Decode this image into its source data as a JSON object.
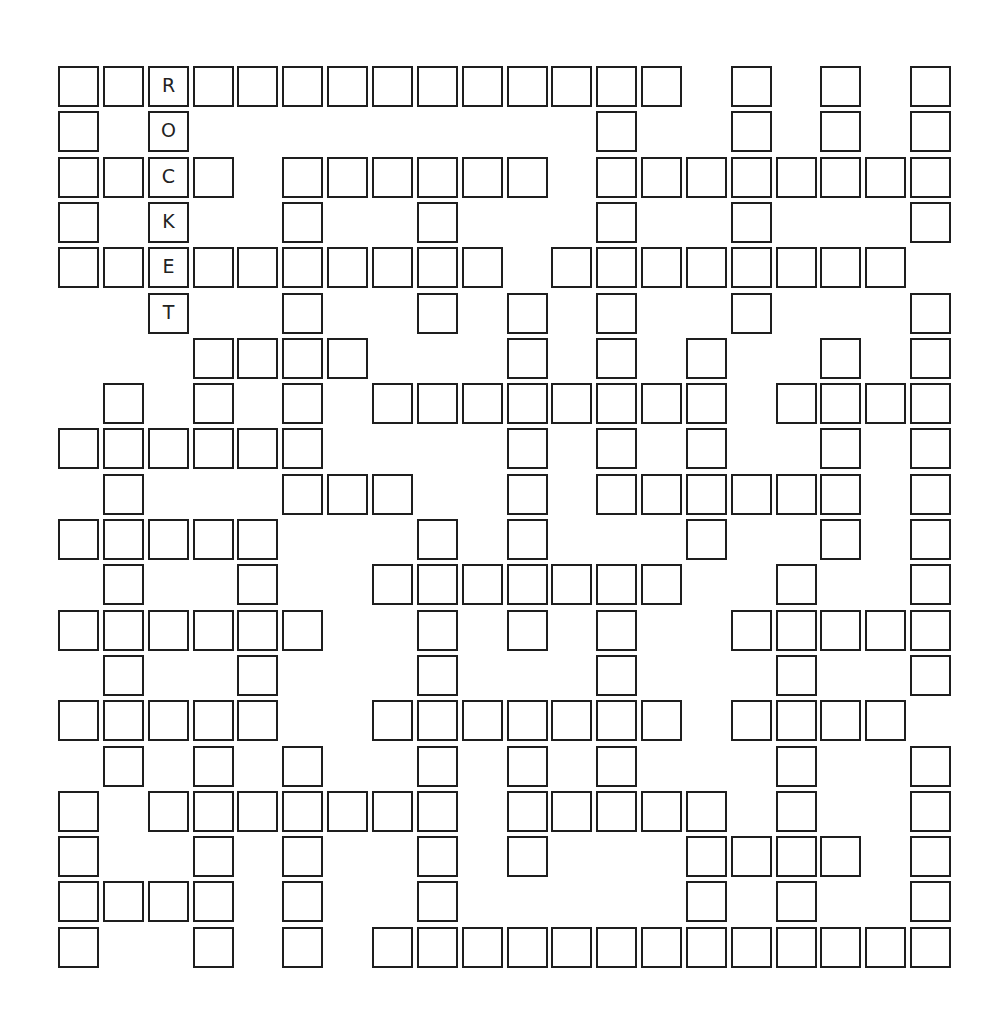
{
  "puzzle": {
    "type": "fill-in crossword grid",
    "rows": 20,
    "cols": 20,
    "border_color": "#1e1e1e",
    "letter_color": "#222222",
    "given_word": "ROCKET",
    "grid": [
      {
        "row": 0,
        "cells": [
          0,
          1,
          2,
          3,
          4,
          5,
          6,
          7,
          8,
          9,
          10,
          11,
          12,
          13,
          15,
          17,
          19
        ]
      },
      {
        "row": 1,
        "cells": [
          0,
          2,
          12,
          15,
          17,
          19
        ]
      },
      {
        "row": 2,
        "cells": [
          0,
          1,
          2,
          3,
          5,
          6,
          7,
          8,
          9,
          10,
          12,
          13,
          14,
          15,
          16,
          17,
          18,
          19
        ]
      },
      {
        "row": 3,
        "cells": [
          0,
          2,
          5,
          8,
          12,
          15,
          19
        ]
      },
      {
        "row": 4,
        "cells": [
          0,
          1,
          2,
          3,
          4,
          5,
          6,
          7,
          8,
          9,
          11,
          12,
          13,
          14,
          15,
          16,
          17,
          18
        ]
      },
      {
        "row": 5,
        "cells": [
          2,
          5,
          8,
          10,
          12,
          15,
          19
        ]
      },
      {
        "row": 6,
        "cells": [
          3,
          4,
          5,
          6,
          10,
          12,
          14,
          17,
          19
        ]
      },
      {
        "row": 7,
        "cells": [
          1,
          3,
          5,
          7,
          8,
          9,
          10,
          11,
          12,
          13,
          14,
          16,
          17,
          18,
          19
        ]
      },
      {
        "row": 8,
        "cells": [
          0,
          1,
          2,
          3,
          4,
          5,
          10,
          12,
          14,
          17,
          19
        ]
      },
      {
        "row": 9,
        "cells": [
          1,
          5,
          6,
          7,
          10,
          12,
          13,
          14,
          15,
          16,
          17,
          19
        ]
      },
      {
        "row": 10,
        "cells": [
          0,
          1,
          2,
          3,
          4,
          8,
          10,
          14,
          17,
          19
        ]
      },
      {
        "row": 11,
        "cells": [
          1,
          4,
          7,
          8,
          9,
          10,
          11,
          12,
          13,
          16,
          19
        ]
      },
      {
        "row": 12,
        "cells": [
          0,
          1,
          2,
          3,
          4,
          5,
          8,
          10,
          12,
          15,
          16,
          17,
          18,
          19
        ]
      },
      {
        "row": 13,
        "cells": [
          1,
          4,
          8,
          12,
          16,
          19
        ]
      },
      {
        "row": 14,
        "cells": [
          0,
          1,
          2,
          3,
          4,
          7,
          8,
          9,
          10,
          11,
          12,
          13,
          15,
          16,
          17,
          18
        ]
      },
      {
        "row": 15,
        "cells": [
          1,
          3,
          5,
          8,
          10,
          12,
          16,
          19
        ]
      },
      {
        "row": 16,
        "cells": [
          0,
          2,
          3,
          4,
          5,
          6,
          7,
          8,
          10,
          11,
          12,
          13,
          14,
          16,
          19
        ]
      },
      {
        "row": 17,
        "cells": [
          0,
          3,
          5,
          8,
          10,
          14,
          15,
          16,
          17,
          19
        ]
      },
      {
        "row": 18,
        "cells": [
          0,
          1,
          2,
          3,
          5,
          8,
          14,
          16,
          19
        ]
      },
      {
        "row": 19,
        "cells": [
          0,
          3,
          5,
          7,
          8,
          9,
          10,
          11,
          12,
          13,
          14,
          15,
          16,
          17,
          18,
          19
        ]
      }
    ],
    "filled_letters": [
      {
        "row": 0,
        "col": 2,
        "letter": "R"
      },
      {
        "row": 1,
        "col": 2,
        "letter": "O"
      },
      {
        "row": 2,
        "col": 2,
        "letter": "C"
      },
      {
        "row": 3,
        "col": 2,
        "letter": "K"
      },
      {
        "row": 4,
        "col": 2,
        "letter": "E"
      },
      {
        "row": 5,
        "col": 2,
        "letter": "T"
      }
    ]
  }
}
